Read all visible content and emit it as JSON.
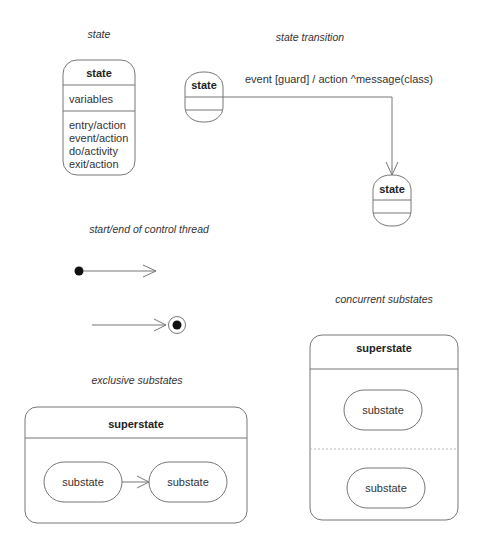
{
  "captions": {
    "state": "state",
    "state_transition": "state transition",
    "control_thread": "start/end of control thread",
    "concurrent": "concurrent substates",
    "exclusive": "exclusive substates"
  },
  "state_box": {
    "name": "state",
    "variables": "variables",
    "actions": [
      "entry/action",
      "event/action",
      "do/activity",
      "exit/action"
    ]
  },
  "transition": {
    "source": "state",
    "target": "state",
    "label": "event  [guard]  / action  ^message(class)"
  },
  "exclusive": {
    "superstate": "superstate",
    "substates": [
      "substate",
      "substate"
    ]
  },
  "concurrent": {
    "superstate": "superstate",
    "substates": [
      "substate",
      "substate"
    ]
  },
  "colors": {
    "line": "#777777",
    "text": "#222222",
    "dot": "#111111"
  }
}
